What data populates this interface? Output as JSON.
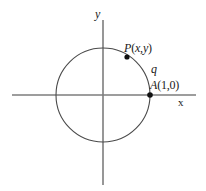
{
  "figure": {
    "width": 206,
    "height": 191,
    "background_color": "#ffffff"
  },
  "axes": {
    "x_label": "x",
    "y_label": "y",
    "axis_color": "#7d7d7d",
    "origin": {
      "x": 103,
      "y": 95
    },
    "x_axis": {
      "x1": 12,
      "y1": 95,
      "x2": 196,
      "y2": 95
    },
    "y_axis": {
      "x1": 103,
      "y1": 20,
      "x2": 103,
      "y2": 185
    }
  },
  "circle": {
    "center_x": 103,
    "center_y": 95,
    "radius": 47,
    "stroke_color": "#4a4a4a",
    "stroke_width": 1,
    "fill": "none"
  },
  "points": [
    {
      "name": "P",
      "label_letter": "P",
      "label_coords": "(x,y)",
      "label_text": "P(x,y)",
      "dot_x": 127,
      "dot_y": 57,
      "dot_radius": 2.6,
      "dot_color": "#111111"
    },
    {
      "name": "A",
      "label_letter": "A",
      "label_coords": "(1,0)",
      "label_text": "A(1,0)",
      "dot_x": 150,
      "dot_y": 95,
      "dot_radius": 2.8,
      "dot_color": "#111111"
    }
  ],
  "angle": {
    "symbol": "q",
    "description": "angle label on arc between A and P"
  },
  "label_parts": {
    "P_letter": "P",
    "P_open": "(",
    "P_x": "x",
    "P_comma": ",",
    "P_y": "y",
    "P_close": ")",
    "A_letter": "A",
    "A_coords": "(1,0)"
  },
  "chart_data": {
    "type": "scatter",
    "xlabel": "x",
    "ylabel": "y",
    "grid": false,
    "legend": null,
    "xlim": [
      -1.94,
      1.98
    ],
    "ylim": [
      -1.91,
      1.6
    ],
    "shapes": [
      {
        "kind": "circle",
        "center": [
          0,
          0
        ],
        "radius": 1,
        "filled": false,
        "note": "unit circle"
      }
    ],
    "points": [
      {
        "label": "P(x,y)",
        "x": 0.51,
        "y": 0.81
      },
      {
        "label": "A(1,0)",
        "x": 1.0,
        "y": 0.0
      }
    ],
    "annotations": [
      {
        "text": "P(x,y)",
        "x": 0.45,
        "y": 1.02
      },
      {
        "text": "q",
        "x": 1.02,
        "y": 0.62
      },
      {
        "text": "A(1,0)",
        "x": 1.0,
        "y": 0.31
      },
      {
        "text": "y",
        "x": -0.17,
        "y": 1.7
      },
      {
        "text": "x",
        "x": 1.6,
        "y": -0.11
      }
    ]
  }
}
